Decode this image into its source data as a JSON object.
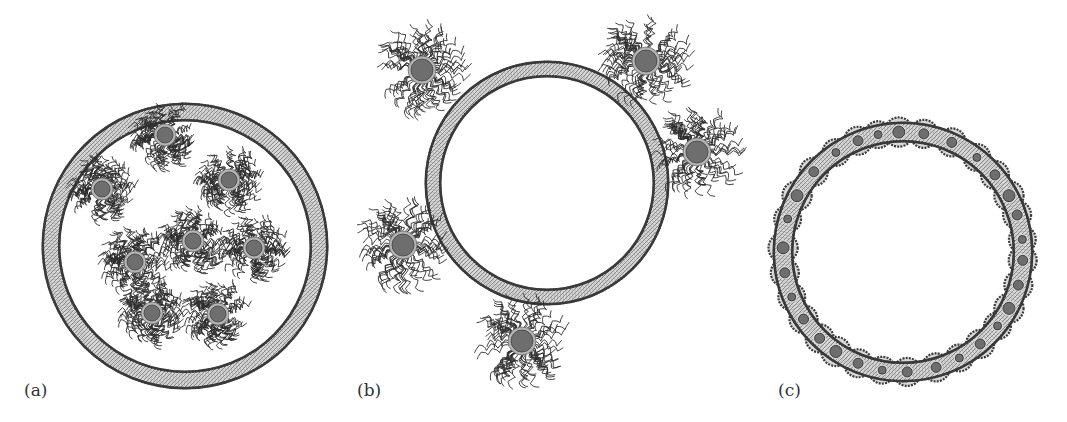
{
  "figure": {
    "colors": {
      "membrane_dark": "#3a3a3a",
      "membrane_light": "#d8d8d8",
      "membrane_mid": "#8a8a8a",
      "core": "#6e6e6e",
      "shell": "#b5b5b5",
      "corona": "#2e2e2e",
      "label": "#333333"
    },
    "panels": [
      {
        "id": "a",
        "label": "(a)",
        "label_pos": [
          24,
          392
        ],
        "caption": "Nanoparticles encapsulated inside vesicle lumen",
        "vesicle": {
          "cx": 185,
          "cy": 246,
          "r": 134,
          "thickness": 16
        },
        "particles": [
          {
            "cx": 165,
            "cy": 135
          },
          {
            "cx": 102,
            "cy": 189
          },
          {
            "cx": 229,
            "cy": 180
          },
          {
            "cx": 135,
            "cy": 262
          },
          {
            "cx": 193,
            "cy": 241
          },
          {
            "cx": 254,
            "cy": 248
          },
          {
            "cx": 152,
            "cy": 313
          },
          {
            "cx": 218,
            "cy": 314
          }
        ],
        "particle_core_r": 8,
        "particle_corona_r": 26
      },
      {
        "id": "b",
        "label": "(b)",
        "label_pos": [
          357,
          392
        ],
        "caption": "Nanoparticles adsorbed on vesicle outer surface",
        "vesicle": {
          "cx": 547,
          "cy": 183,
          "r": 114,
          "thickness": 14
        },
        "particles": [
          {
            "cx": 422,
            "cy": 70
          },
          {
            "cx": 646,
            "cy": 61
          },
          {
            "cx": 697,
            "cy": 152
          },
          {
            "cx": 403,
            "cy": 245
          },
          {
            "cx": 522,
            "cy": 341
          }
        ],
        "particle_core_r": 11,
        "particle_corona_r": 36
      },
      {
        "id": "c",
        "label": "(c)",
        "label_pos": [
          778,
          392
        ],
        "caption": "Nanoparticles embedded within the lipid bilayer",
        "vesicle": {
          "cx": 903,
          "cy": 252,
          "r": 120,
          "thickness": 18
        },
        "embedded": [
          {
            "angle": -92,
            "size": 6
          },
          {
            "angle": -80,
            "size": 5
          },
          {
            "angle": -66,
            "size": 5
          },
          {
            "angle": -52,
            "size": 4
          },
          {
            "angle": -40,
            "size": 5
          },
          {
            "angle": -28,
            "size": 6
          },
          {
            "angle": -18,
            "size": 5
          },
          {
            "angle": -6,
            "size": 4
          },
          {
            "angle": 4,
            "size": 5
          },
          {
            "angle": 16,
            "size": 5
          },
          {
            "angle": 28,
            "size": 6
          },
          {
            "angle": 38,
            "size": 4
          },
          {
            "angle": 50,
            "size": 5
          },
          {
            "angle": 62,
            "size": 4
          },
          {
            "angle": 74,
            "size": 5
          },
          {
            "angle": 88,
            "size": 5
          },
          {
            "angle": 100,
            "size": 4
          },
          {
            "angle": 112,
            "size": 5
          },
          {
            "angle": 124,
            "size": 6
          },
          {
            "angle": 134,
            "size": 5
          },
          {
            "angle": 146,
            "size": 5
          },
          {
            "angle": 158,
            "size": 4
          },
          {
            "angle": 170,
            "size": 5
          },
          {
            "angle": 182,
            "size": 6
          },
          {
            "angle": 196,
            "size": 4
          },
          {
            "angle": 208,
            "size": 6
          },
          {
            "angle": 222,
            "size": 5
          },
          {
            "angle": 236,
            "size": 4
          },
          {
            "angle": 248,
            "size": 5
          },
          {
            "angle": 258,
            "size": 4
          }
        ]
      }
    ]
  }
}
